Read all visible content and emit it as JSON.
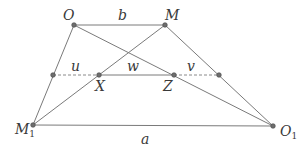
{
  "diagram": {
    "title": "",
    "points": {
      "O": {
        "label": "O",
        "sub": ""
      },
      "M": {
        "label": "M",
        "sub": ""
      },
      "M1": {
        "label": "M",
        "sub": "1"
      },
      "O1": {
        "label": "O",
        "sub": "1"
      },
      "X": {
        "label": "X",
        "sub": ""
      },
      "Z": {
        "label": "Z",
        "sub": ""
      }
    },
    "segments": {
      "top": "b",
      "bottom": "a",
      "left_dashed": "u",
      "middle": "w",
      "right_dashed": "v"
    }
  }
}
